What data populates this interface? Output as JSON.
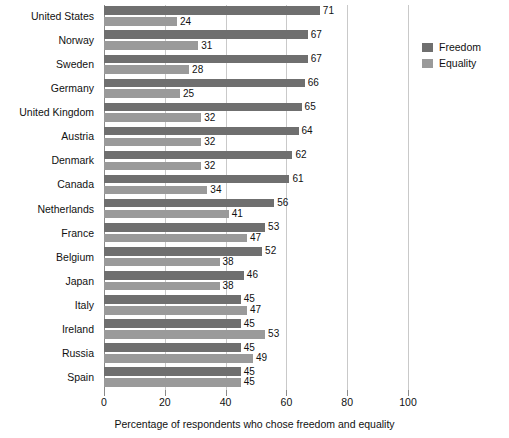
{
  "chart_data": {
    "type": "bar",
    "orientation": "horizontal",
    "title": "",
    "xlabel": "Percentage of respondents who chose freedom and equality",
    "ylabel": "",
    "xlim": [
      0,
      100
    ],
    "xticks": [
      0,
      20,
      40,
      60,
      80,
      100
    ],
    "xtick_labels": [
      "0",
      "20",
      "40",
      "60",
      "80",
      "100"
    ],
    "grid": true,
    "grid_axis": "x",
    "legend_position": "right",
    "categories": [
      "United States",
      "Norway",
      "Sweden",
      "Germany",
      "United Kingdom",
      "Austria",
      "Denmark",
      "Canada",
      "Netherlands",
      "France",
      "Belgium",
      "Japan",
      "Italy",
      "Ireland",
      "Russia",
      "Spain"
    ],
    "series": [
      {
        "name": "Freedom",
        "color": "#6f6f6f",
        "values": [
          71,
          67,
          67,
          66,
          65,
          64,
          62,
          61,
          56,
          53,
          52,
          46,
          45,
          45,
          45,
          45
        ]
      },
      {
        "name": "Equality",
        "color": "#9a9a9a",
        "values": [
          24,
          31,
          28,
          25,
          32,
          32,
          32,
          34,
          41,
          47,
          38,
          38,
          47,
          53,
          49,
          45
        ]
      }
    ]
  },
  "legend": {
    "items": [
      {
        "label": "Freedom",
        "color": "#6f6f6f"
      },
      {
        "label": "Equality",
        "color": "#9a9a9a"
      }
    ]
  },
  "axis": {
    "x_caption": "Percentage of respondents who chose freedom and equality"
  }
}
